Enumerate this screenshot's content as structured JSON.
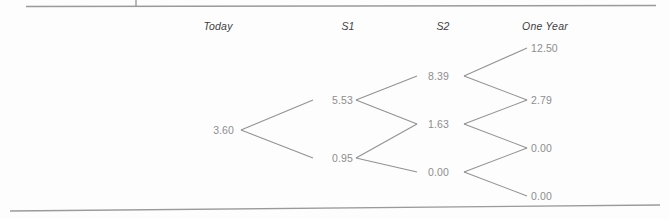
{
  "figure": {
    "type": "binomial-tree-diagram",
    "line_color": "#8d8d8d",
    "value_color": "#8e8e8e",
    "header_color": "#3d3d3d",
    "background": "#fdfdfd"
  },
  "columns": [
    {
      "label": "Today",
      "x": 218
    },
    {
      "label": "S1",
      "x": 348
    },
    {
      "label": "S2",
      "x": 443
    },
    {
      "label": "One Year",
      "x": 545
    }
  ],
  "chart_data": {
    "type": "diagram",
    "title": "",
    "xlabel": "",
    "ylabel": "",
    "stage_labels": [
      "Today",
      "S1",
      "S2",
      "One Year"
    ],
    "nodes": [
      {
        "id": "n0",
        "stage": 0,
        "stage_label": "Today",
        "value": "3.60",
        "x": 234,
        "y": 130,
        "anchor": "right"
      },
      {
        "id": "n1u",
        "stage": 1,
        "stage_label": "S1",
        "value": "5.53",
        "x": 332,
        "y": 100,
        "anchor": "left"
      },
      {
        "id": "n1d",
        "stage": 1,
        "stage_label": "S1",
        "value": "0.95",
        "x": 332,
        "y": 158,
        "anchor": "left"
      },
      {
        "id": "n2uu",
        "stage": 2,
        "stage_label": "S2",
        "value": "8.39",
        "x": 428,
        "y": 76,
        "anchor": "left"
      },
      {
        "id": "n2ud",
        "stage": 2,
        "stage_label": "S2",
        "value": "1.63",
        "x": 428,
        "y": 124,
        "anchor": "left"
      },
      {
        "id": "n2dd",
        "stage": 2,
        "stage_label": "S2",
        "value": "0.00",
        "x": 428,
        "y": 172,
        "anchor": "left"
      },
      {
        "id": "n3a",
        "stage": 3,
        "stage_label": "One Year",
        "value": "12.50",
        "x": 531,
        "y": 48,
        "anchor": "left"
      },
      {
        "id": "n3b",
        "stage": 3,
        "stage_label": "One Year",
        "value": "2.79",
        "x": 531,
        "y": 100,
        "anchor": "left"
      },
      {
        "id": "n3c",
        "stage": 3,
        "stage_label": "One Year",
        "value": "0.00",
        "x": 531,
        "y": 148,
        "anchor": "left"
      },
      {
        "id": "n3d",
        "stage": 3,
        "stage_label": "One Year",
        "value": "0.00",
        "x": 531,
        "y": 196,
        "anchor": "left"
      }
    ],
    "edges": [
      {
        "from": "n0",
        "to": "n1u",
        "x1": 241,
        "y1": 130,
        "x2": 313,
        "y2": 100
      },
      {
        "from": "n0",
        "to": "n1d",
        "x1": 241,
        "y1": 130,
        "x2": 313,
        "y2": 158
      },
      {
        "from": "n1u",
        "to": "n2uu",
        "x1": 356,
        "y1": 100,
        "x2": 417,
        "y2": 76
      },
      {
        "from": "n1u",
        "to": "n2ud",
        "x1": 356,
        "y1": 100,
        "x2": 417,
        "y2": 124
      },
      {
        "from": "n1d",
        "to": "n2ud",
        "x1": 356,
        "y1": 158,
        "x2": 417,
        "y2": 124
      },
      {
        "from": "n1d",
        "to": "n2dd",
        "x1": 356,
        "y1": 158,
        "x2": 417,
        "y2": 172
      },
      {
        "from": "n2uu",
        "to": "n3a",
        "x1": 464,
        "y1": 76,
        "x2": 527,
        "y2": 48
      },
      {
        "from": "n2uu",
        "to": "n3b",
        "x1": 464,
        "y1": 76,
        "x2": 527,
        "y2": 100
      },
      {
        "from": "n2ud",
        "to": "n3b",
        "x1": 464,
        "y1": 124,
        "x2": 527,
        "y2": 100
      },
      {
        "from": "n2ud",
        "to": "n3c",
        "x1": 464,
        "y1": 124,
        "x2": 527,
        "y2": 148
      },
      {
        "from": "n2dd",
        "to": "n3c",
        "x1": 464,
        "y1": 172,
        "x2": 527,
        "y2": 148
      },
      {
        "from": "n2dd",
        "to": "n3d",
        "x1": 464,
        "y1": 172,
        "x2": 527,
        "y2": 196
      }
    ]
  },
  "rules": {
    "top": {
      "x1": 26,
      "y1": 6.5,
      "x2": 656,
      "y2": 5.5
    },
    "top_tick": {
      "x1": 136,
      "y1": 0,
      "x2": 136,
      "y2": 6.5
    },
    "bottom": {
      "x1": 10,
      "y1": 211,
      "x2": 660,
      "y2": 205
    }
  }
}
